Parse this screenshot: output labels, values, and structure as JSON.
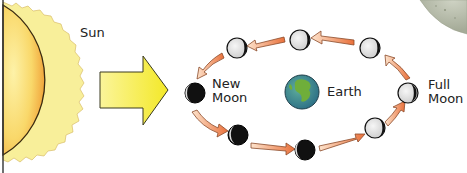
{
  "diagram": {
    "labels": {
      "sun": "Sun",
      "new_moon": "New\nMoon",
      "earth": "Earth",
      "full_moon": "Full\nMoon"
    },
    "colors": {
      "sun_fill_light": "#fbe98a",
      "sun_fill_dark": "#f0a83a",
      "sun_corona": "#f8ef9a",
      "arrow_yellow": "#f5ee3a",
      "orbit_arrow": "#ec8a5a",
      "moon_light": "#e6e6e6",
      "moon_dark": "#111111",
      "earth_ocean": "#3f8ea0",
      "earth_land": "#6fae3a",
      "lunar_surface": "#b9bfae"
    },
    "moons": [
      {
        "id": "new-moon",
        "phase": "new",
        "cx": 195,
        "cy": 93
      },
      {
        "id": "waxing-crescent",
        "phase": "crescent",
        "cx": 238,
        "cy": 135
      },
      {
        "id": "first-quarter-approach",
        "phase": "crescent-b",
        "cx": 305,
        "cy": 150
      },
      {
        "id": "waxing-gibbous",
        "phase": "gibbous",
        "cx": 375,
        "cy": 130
      },
      {
        "id": "full-moon",
        "phase": "full",
        "cx": 408,
        "cy": 93
      },
      {
        "id": "waning-gibbous",
        "phase": "gibbous-top",
        "cx": 370,
        "cy": 48
      },
      {
        "id": "last-quarter",
        "phase": "light",
        "cx": 300,
        "cy": 40
      },
      {
        "id": "waning-crescent",
        "phase": "light",
        "cx": 237,
        "cy": 48
      }
    ]
  }
}
